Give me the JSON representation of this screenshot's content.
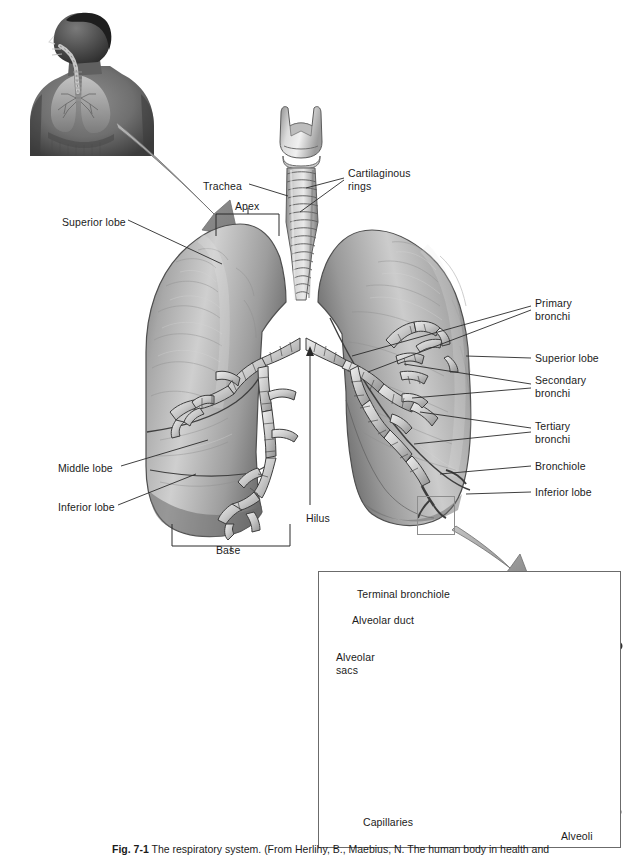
{
  "figure": {
    "number": "Fig. 7-1",
    "caption_title": "The respiratory system.",
    "caption_source": "(From Herlihy, B., Maebius, N. The human body in health and illness.",
    "alt": "Anatomical illustration of the respiratory system"
  },
  "colors": {
    "ink": "#1b1b1b",
    "leader": "#2a2a2a",
    "arrow_fill": "#9a9a9a",
    "arrow_stroke": "#6e6e6e",
    "lung_light": "#d8d8d8",
    "lung_mid": "#9e9e9e",
    "lung_dark": "#5a5a5a",
    "box_border": "#6b6b6b",
    "sel_border": "#8d8d8d",
    "page_bg": "#ffffff"
  },
  "inset_torso": {
    "name": "torso-thumbnail",
    "description": "Grayscale photo-illustration of a male torso showing lungs and trachea in situ"
  },
  "main_diagram": {
    "name": "lungs-diagram",
    "structures": [
      "larynx",
      "trachea",
      "right-lung",
      "left-lung",
      "bronchial-tree",
      "hilus"
    ]
  },
  "labels_left": [
    {
      "id": "superior-lobe-left",
      "text": "Superior lobe",
      "x": 62,
      "y": 216
    },
    {
      "id": "middle-lobe",
      "text": "Middle lobe",
      "x": 58,
      "y": 462
    },
    {
      "id": "inferior-lobe-left",
      "text": "Inferior lobe",
      "x": 58,
      "y": 501
    }
  ],
  "labels_top": [
    {
      "id": "trachea",
      "text": "Trachea",
      "x": 203,
      "y": 180
    },
    {
      "id": "apex",
      "text": "Apex",
      "x": 235,
      "y": 202
    },
    {
      "id": "cartilaginous-rings",
      "text": "Cartilaginous\nrings",
      "x": 348,
      "y": 167
    }
  ],
  "labels_bottom": [
    {
      "id": "hilus",
      "text": "Hilus",
      "x": 306,
      "y": 512
    },
    {
      "id": "base",
      "text": "Base",
      "x": 222,
      "y": 544
    }
  ],
  "labels_right": [
    {
      "id": "primary-bronchi",
      "text": "Primary\nbronchi",
      "x": 535,
      "y": 297
    },
    {
      "id": "superior-lobe-right",
      "text": "Superior lobe",
      "x": 535,
      "y": 353
    },
    {
      "id": "secondary-bronchi",
      "text": "Secondary\nbronchi",
      "x": 535,
      "y": 374
    },
    {
      "id": "tertiary-bronchi",
      "text": "Tertiary\nbronchi",
      "x": 535,
      "y": 420
    },
    {
      "id": "bronchiole",
      "text": "Bronchiole",
      "x": 535,
      "y": 460
    },
    {
      "id": "inferior-lobe-right",
      "text": "Inferior lobe",
      "x": 535,
      "y": 486
    }
  ],
  "inset_labels": [
    {
      "id": "terminal-bronchiole",
      "text": "Terminal bronchiole",
      "x": 357,
      "y": 588
    },
    {
      "id": "alveolar-duct",
      "text": "Alveolar duct",
      "x": 352,
      "y": 614
    },
    {
      "id": "alveolar-sacs",
      "text": "Alveolar\nsacs",
      "x": 340,
      "y": 651
    },
    {
      "id": "capillaries",
      "text": "Capillaries",
      "x": 363,
      "y": 816
    },
    {
      "id": "alveoli",
      "text": "Alveoli",
      "x": 561,
      "y": 830
    }
  ],
  "inset_detail": {
    "name": "alveoli-detail",
    "structures": [
      "terminal-bronchiole",
      "alveolar-duct",
      "alveolar-sacs",
      "capillary-network",
      "alveoli-cluster"
    ]
  },
  "callouts": [
    {
      "id": "torso-to-lungs-arrow",
      "from": "torso-thumbnail",
      "to": "lungs-diagram"
    },
    {
      "id": "lung-to-inset-arrow",
      "from": "selection-box",
      "to": "alveoli-detail"
    }
  ]
}
